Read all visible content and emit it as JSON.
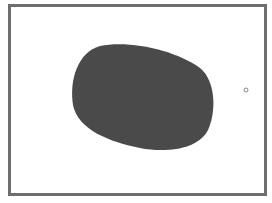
{
  "figure": {
    "frame_color": "#6e6e6e",
    "background": "#ffffff",
    "blob": {
      "shape": "rounded-oval",
      "fill": "#4a4a4a",
      "bounds": {
        "left": 72,
        "top": 44,
        "right": 215,
        "bottom": 151
      }
    },
    "marker": {
      "shape": "small-circle",
      "cx": 246,
      "cy": 90,
      "r": 2,
      "stroke": "#8a8a8a"
    }
  }
}
